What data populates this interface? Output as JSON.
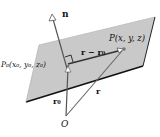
{
  "diagram": {
    "type": "vector-plane-equation",
    "colors": {
      "plane_fill": "#c9c9c9",
      "plane_edge": "#1a1a1a",
      "vector": "#555555",
      "background": "#ffffff"
    },
    "labels": {
      "normal": "n",
      "point": "P(x, y, z)",
      "point0": "P₀(x₀, y₀, z₀)",
      "difference": "r − r₀",
      "r0": "r₀",
      "r": "r",
      "origin": "O"
    }
  }
}
